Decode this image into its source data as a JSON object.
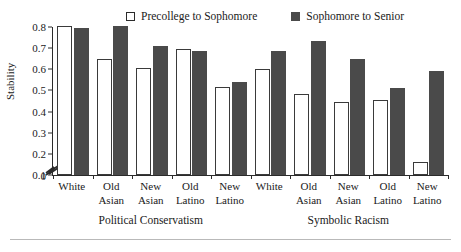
{
  "chart_data": {
    "type": "bar",
    "title": "",
    "xlabel": "",
    "ylabel": "Stability",
    "ylim": [
      0.1,
      0.8
    ],
    "y_axis_break": true,
    "y_zero_tick": "0",
    "yticks": [
      "0.1",
      "0.2",
      "0.3",
      "0.4",
      "0.5",
      "0.6",
      "0.7",
      "0.8"
    ],
    "ytick_values": [
      0.1,
      0.2,
      0.3,
      0.4,
      0.5,
      0.6,
      0.7,
      0.8
    ],
    "grid": false,
    "legend_position": "top",
    "categories": [
      "White",
      "Old Asian",
      "New Asian",
      "Old Latino",
      "New Latino",
      "White",
      "Old Asian",
      "New Asian",
      "Old Latino",
      "New Latino"
    ],
    "groups": [
      {
        "label": "Political Conservatism",
        "categories": [
          "White",
          "Old Asian",
          "New Asian",
          "Old Latino",
          "New Latino"
        ]
      },
      {
        "label": "Symbolic Racism",
        "categories": [
          "White",
          "Old Asian",
          "New Asian",
          "Old Latino",
          "New Latino"
        ]
      }
    ],
    "series": [
      {
        "name": "Precollege to Sophomore",
        "color": "#ffffff",
        "values": [
          0.805,
          0.65,
          0.608,
          0.697,
          0.518,
          0.6,
          0.485,
          0.446,
          0.456,
          0.162
        ]
      },
      {
        "name": "Sophomore to Senior",
        "color": "#4a4a4a",
        "values": [
          0.793,
          0.803,
          0.708,
          0.686,
          0.542,
          0.687,
          0.735,
          0.65,
          0.51,
          0.59
        ]
      }
    ]
  },
  "legend": {
    "entries": [
      {
        "label": "Precollege to Sophomore",
        "swatch": "open-square-icon"
      },
      {
        "label": "Sophomore to Senior",
        "swatch": "filled-square-icon"
      }
    ]
  },
  "axes": {
    "y_title": "Stability"
  }
}
